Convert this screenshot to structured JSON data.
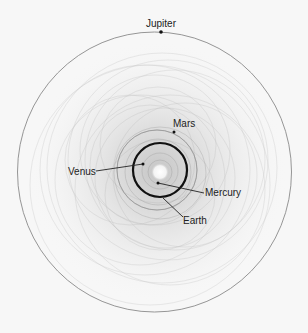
{
  "diagram": {
    "labels": {
      "jupiter": "Jupiter",
      "mars": "Mars",
      "venus": "Venus",
      "mercury": "Mercury",
      "earth": "Earth"
    },
    "colors": {
      "background": "#f7f7f7",
      "jupiter_orbit": "#8a8a8a",
      "earth_orbit": "#111111",
      "traces": "#b0b0b0",
      "text": "#222222"
    }
  }
}
